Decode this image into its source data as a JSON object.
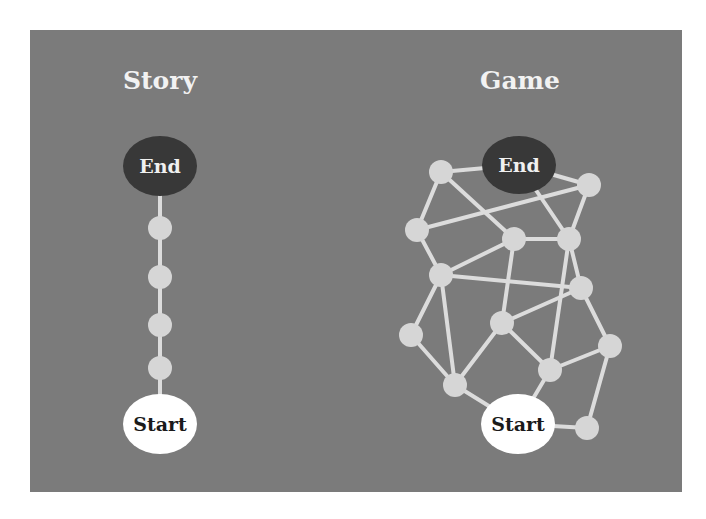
{
  "colors": {
    "background": "#ffffff",
    "panel": "#7b7b7b",
    "edge": "#dcdcdc",
    "node": "#d6d6d6",
    "end_node": "#383838",
    "start_node": "#ffffff"
  },
  "panel": {
    "x": 30,
    "y": 30,
    "w": 652,
    "h": 462
  },
  "story": {
    "title": "Story",
    "title_pos": [
      160,
      80
    ],
    "end": {
      "label": "End",
      "x": 160,
      "y": 166,
      "rx": 37,
      "ry": 30
    },
    "start": {
      "label": "Start",
      "x": 160,
      "y": 424,
      "rx": 37,
      "ry": 30
    },
    "intermediate_nodes": [
      {
        "x": 160,
        "y": 228
      },
      {
        "x": 160,
        "y": 277
      },
      {
        "x": 160,
        "y": 325
      },
      {
        "x": 160,
        "y": 368
      }
    ]
  },
  "game": {
    "title": "Game",
    "title_pos": [
      520,
      80
    ],
    "end": {
      "label": "End",
      "x": 519,
      "y": 165,
      "rx": 37,
      "ry": 29
    },
    "start": {
      "label": "Start",
      "x": 518,
      "y": 424,
      "rx": 37,
      "ry": 30
    },
    "nodes": {
      "n1": {
        "x": 441,
        "y": 172
      },
      "n2": {
        "x": 589,
        "y": 185
      },
      "n3": {
        "x": 417,
        "y": 230
      },
      "n4": {
        "x": 514,
        "y": 239
      },
      "n5": {
        "x": 569,
        "y": 239
      },
      "n6": {
        "x": 441,
        "y": 275
      },
      "n7": {
        "x": 581,
        "y": 288
      },
      "n8": {
        "x": 411,
        "y": 335
      },
      "n9": {
        "x": 502,
        "y": 323
      },
      "n10": {
        "x": 610,
        "y": 346
      },
      "n11": {
        "x": 455,
        "y": 385
      },
      "n12": {
        "x": 550,
        "y": 370
      },
      "n13": {
        "x": 587,
        "y": 428
      }
    },
    "edges": [
      [
        "n1",
        "end"
      ],
      [
        "end",
        "n2"
      ],
      [
        "n1",
        "n3"
      ],
      [
        "n1",
        "n4"
      ],
      [
        "n3",
        "n2"
      ],
      [
        "end",
        "n5"
      ],
      [
        "n2",
        "n5"
      ],
      [
        "n4",
        "n5"
      ],
      [
        "n3",
        "n6"
      ],
      [
        "n6",
        "n4"
      ],
      [
        "n6",
        "n7"
      ],
      [
        "n5",
        "n7"
      ],
      [
        "n5",
        "n12"
      ],
      [
        "n4",
        "n9"
      ],
      [
        "n6",
        "n8"
      ],
      [
        "n6",
        "n11"
      ],
      [
        "n9",
        "n7"
      ],
      [
        "n9",
        "n11"
      ],
      [
        "n9",
        "n12"
      ],
      [
        "n8",
        "n11"
      ],
      [
        "n7",
        "n10"
      ],
      [
        "n12",
        "n10"
      ],
      [
        "n11",
        "start"
      ],
      [
        "n12",
        "start"
      ],
      [
        "start",
        "n13"
      ],
      [
        "n10",
        "n13"
      ]
    ]
  }
}
